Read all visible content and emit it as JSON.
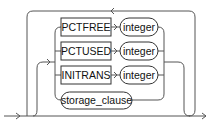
{
  "diagram": {
    "type": "railroad-syntax",
    "keywords": [
      {
        "label": "PCTFREE",
        "param": "integer"
      },
      {
        "label": "PCTUSED",
        "param": "integer"
      },
      {
        "label": "INITRANS",
        "param": "integer"
      }
    ],
    "clause": {
      "label": "storage_clause"
    },
    "colors": {
      "line": "#555555",
      "text": "#111111",
      "background": "#ffffff"
    }
  }
}
